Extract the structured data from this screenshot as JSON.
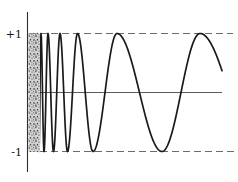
{
  "labels": {
    "plus_one": "+1",
    "minus_one": "-1"
  },
  "chart_data": {
    "type": "line",
    "title": "",
    "xlabel": "",
    "ylabel": "",
    "ylim": [
      -1,
      1
    ],
    "xaxis_shown": true,
    "grid": false,
    "ytick_labels": [
      "+1",
      "-1"
    ],
    "reference_lines": [
      {
        "y": 1,
        "style": "dashed",
        "label": "+1"
      },
      {
        "y": -1,
        "style": "dashed",
        "label": "-1"
      }
    ],
    "dense_band_x_px": [
      28.5,
      40
    ],
    "curve_end_x_px": 222,
    "curve_end_value": 0.37,
    "extrema_px_value": [
      [
        37.3,
        1
      ],
      [
        38.9,
        -1
      ],
      [
        41,
        1
      ],
      [
        44,
        -1
      ],
      [
        48,
        1
      ],
      [
        53.5,
        -1
      ],
      [
        60,
        1
      ],
      [
        67.5,
        -1
      ],
      [
        77.5,
        1
      ],
      [
        93,
        -1
      ],
      [
        117,
        1
      ],
      [
        162,
        -1
      ],
      [
        200,
        1
      ],
      [
        258,
        -1
      ]
    ],
    "colors": {
      "curve": "#1a1a1a",
      "axis": "#2e2e2e",
      "x_axis": "#4a4a4a",
      "dashed": "#6b6b6b",
      "stipple_bg": "#d2d2d2",
      "stipple_dots": "#2a2a2a"
    }
  }
}
